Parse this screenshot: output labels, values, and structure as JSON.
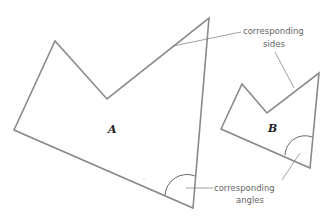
{
  "diagram": {
    "shapes": [
      {
        "label": "A"
      },
      {
        "label": "B"
      }
    ],
    "annotations": {
      "sides": {
        "line1": "corresponding",
        "line2": "sides"
      },
      "angles": {
        "line1": "corresponding",
        "line2": "angles"
      }
    }
  }
}
